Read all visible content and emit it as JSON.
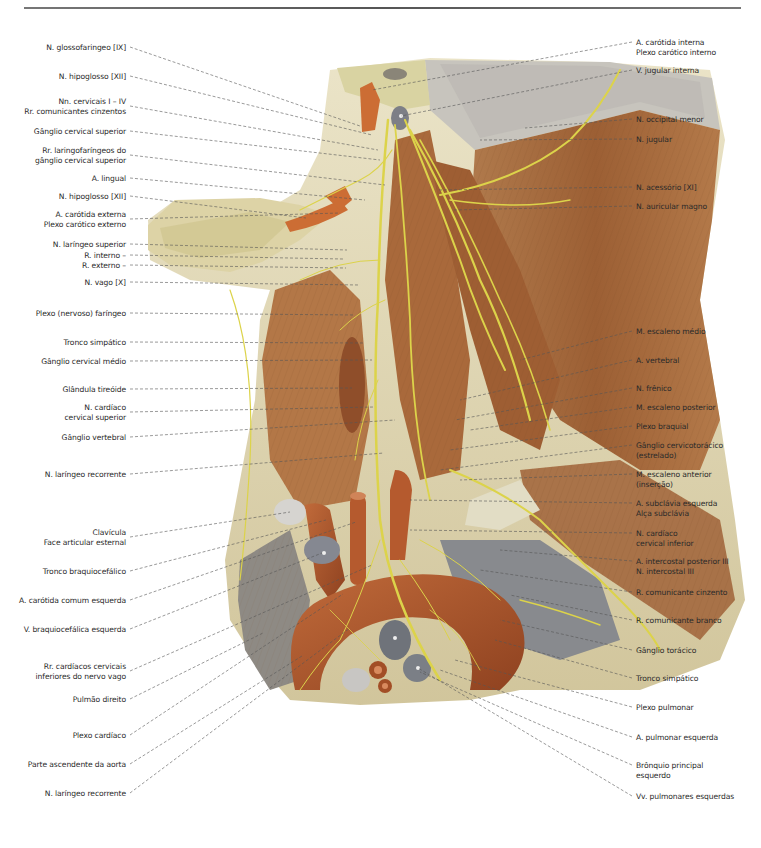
{
  "figure": {
    "colors": {
      "muscle": "#a8683a",
      "muscle_dark": "#7c4524",
      "nerve": "#dcd34a",
      "artery": "#b85a2c",
      "vein_gray": "#7d7f86",
      "bone_gray": "#c7c4bd",
      "fascia": "#d8cfa0",
      "leader_line": "#555555"
    }
  },
  "labels_left": [
    {
      "lines": [
        "N. glossofaringeo [IX]"
      ],
      "y": 43
    },
    {
      "lines": [
        "N. hipoglosso [XII]"
      ],
      "y": 72
    },
    {
      "lines": [
        "Nn. cervicais I – IV",
        "Rr. comunicantes cinzentos"
      ],
      "y": 97
    },
    {
      "lines": [
        "Gânglio cervical superior"
      ],
      "y": 127
    },
    {
      "lines": [
        "Rr. laringofaríngeos do",
        "gânglio cervical superior"
      ],
      "y": 146
    },
    {
      "lines": [
        "A. lingual"
      ],
      "y": 174
    },
    {
      "lines": [
        "N. hipoglosso [XII]"
      ],
      "y": 192
    },
    {
      "lines": [
        "A. carótida externa",
        "Plexo carótico externo"
      ],
      "y": 210
    },
    {
      "lines": [
        "N. laríngeo superior"
      ],
      "y": 240
    },
    {
      "lines": [
        "R. interno –"
      ],
      "y": 251
    },
    {
      "lines": [
        "R. externo –"
      ],
      "y": 261
    },
    {
      "lines": [
        "N. vago [X]"
      ],
      "y": 278
    },
    {
      "lines": [
        "Plexo (nervoso) faríngeo"
      ],
      "y": 309
    },
    {
      "lines": [
        "Tronco simpático"
      ],
      "y": 338
    },
    {
      "lines": [
        "Gânglio cervical médio"
      ],
      "y": 357
    },
    {
      "lines": [
        "Glândula tireóide"
      ],
      "y": 385
    },
    {
      "lines": [
        "N. cardíaco",
        "cervical superior"
      ],
      "y": 403
    },
    {
      "lines": [
        "Gânglio vertebral"
      ],
      "y": 433
    },
    {
      "lines": [
        "N. laríngeo recorrente"
      ],
      "y": 470
    },
    {
      "lines": [
        "Clavícula",
        "Face articular esternal"
      ],
      "y": 528
    },
    {
      "lines": [
        "Tronco braquiocefálico"
      ],
      "y": 567
    },
    {
      "lines": [
        "A. carótida comum esquerda"
      ],
      "y": 596
    },
    {
      "lines": [
        "V. braquiocefálica esquerda"
      ],
      "y": 625
    },
    {
      "lines": [
        "Rr. cardíacos cervicais",
        "inferiores do nervo vago"
      ],
      "y": 662
    },
    {
      "lines": [
        "Pulmão direito"
      ],
      "y": 695
    },
    {
      "lines": [
        "Plexo cardíaco"
      ],
      "y": 731
    },
    {
      "lines": [
        "Parte ascendente da aorta"
      ],
      "y": 760
    },
    {
      "lines": [
        "N. laríngeo recorrente"
      ],
      "y": 789
    }
  ],
  "labels_right": [
    {
      "lines": [
        "A. carótida interna",
        "Plexo carótico interno"
      ],
      "y": 38
    },
    {
      "lines": [
        "V. jugular interna"
      ],
      "y": 66
    },
    {
      "lines": [
        "N. occipital menor"
      ],
      "y": 115
    },
    {
      "lines": [
        "N. jugular"
      ],
      "y": 135
    },
    {
      "lines": [
        "N. acessório [XI]"
      ],
      "y": 183
    },
    {
      "lines": [
        "N. auricular magno"
      ],
      "y": 202
    },
    {
      "lines": [
        "M. escaleno médio"
      ],
      "y": 327
    },
    {
      "lines": [
        "A. vertebral"
      ],
      "y": 356
    },
    {
      "lines": [
        "N. frênico"
      ],
      "y": 384
    },
    {
      "lines": [
        "M. escaleno posterior"
      ],
      "y": 403
    },
    {
      "lines": [
        "Plexo braquial"
      ],
      "y": 422
    },
    {
      "lines": [
        "Gânglio cervicotorácico",
        "(estrelado)"
      ],
      "y": 441
    },
    {
      "lines": [
        "M. escaleno anterior",
        "(inserção)"
      ],
      "y": 470
    },
    {
      "lines": [
        "A. subclávia esquerda",
        "Alça subclávia"
      ],
      "y": 499
    },
    {
      "lines": [
        "N. cardíaco",
        "cervical inferior"
      ],
      "y": 529
    },
    {
      "lines": [
        "A. intercostal posterior III",
        "N. intercostal III"
      ],
      "y": 557
    },
    {
      "lines": [
        "R. comunicante cinzento"
      ],
      "y": 588
    },
    {
      "lines": [
        "R. comunicante branco"
      ],
      "y": 616
    },
    {
      "lines": [
        "Gânglio torácico"
      ],
      "y": 646
    },
    {
      "lines": [
        "Tronco simpático"
      ],
      "y": 674
    },
    {
      "lines": [
        "Plexo pulmonar"
      ],
      "y": 703
    },
    {
      "lines": [
        "A. pulmonar esquerda"
      ],
      "y": 733
    },
    {
      "lines": [
        "Brônquio principal",
        "esquerdo"
      ],
      "y": 761
    },
    {
      "lines": [
        "Vv. pulmonares esquerdas"
      ],
      "y": 792
    }
  ]
}
